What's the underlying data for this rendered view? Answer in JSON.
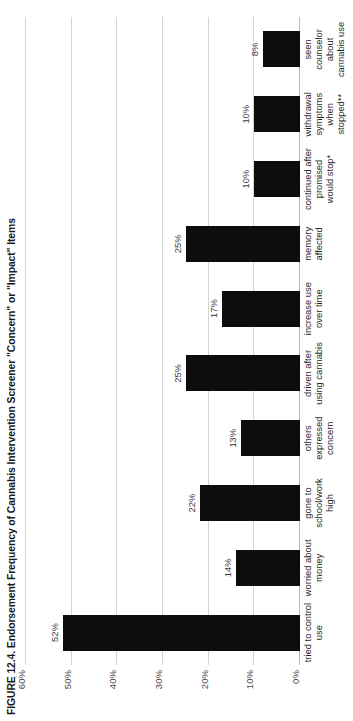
{
  "figure": {
    "title": "FIGURE 12.4. Endorsement Frequency of Cannabis Intervention Screener \"Concern\" or \"Impact\" Items"
  },
  "chart_data": {
    "type": "bar",
    "title": "FIGURE 12.4. Endorsement Frequency of Cannabis Intervention Screener \"Concern\" or \"Impact\" Items",
    "xlabel": "",
    "ylabel": "",
    "orientation": "vertical",
    "grid": true,
    "legend": "none",
    "ylim": [
      0,
      60
    ],
    "yticks": [
      0,
      10,
      20,
      30,
      40,
      50,
      60
    ],
    "ytick_labels": [
      "0%",
      "10%",
      "20%",
      "30%",
      "40%",
      "50%",
      "60%"
    ],
    "bar_color": "#0d0d0d",
    "categories": [
      "tried to control use",
      "worried about money",
      "gone to school/work high",
      "others expressed concern",
      "driven after using cannabis",
      "increase use over time",
      "memory affected",
      "continued after promised would stop*",
      "withdrawal symptoms when stopped**",
      "seen counselor about cannabis use"
    ],
    "values": [
      52,
      14,
      22,
      13,
      25,
      17,
      25,
      10,
      10,
      8
    ],
    "value_labels": [
      "52%",
      "14%",
      "22%",
      "13%",
      "25%",
      "17%",
      "25%",
      "10%",
      "10%",
      "8%"
    ]
  }
}
